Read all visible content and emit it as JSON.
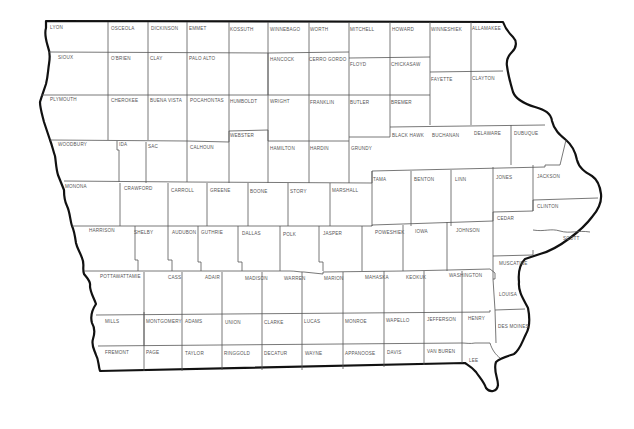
{
  "map": {
    "title": "Iowa Counties",
    "background": "#ffffff",
    "line_color": "#111111"
  },
  "counties": [
    {
      "name": "LYON",
      "x": 50,
      "y": 25
    },
    {
      "name": "OSCEOLA",
      "x": 111,
      "y": 26
    },
    {
      "name": "DICKINSON",
      "x": 151,
      "y": 26
    },
    {
      "name": "EMMET",
      "x": 189,
      "y": 26
    },
    {
      "name": "KOSSUTH",
      "x": 230,
      "y": 27
    },
    {
      "name": "WINNEBAGO",
      "x": 270,
      "y": 27
    },
    {
      "name": "WORTH",
      "x": 310,
      "y": 27
    },
    {
      "name": "MITCHELL",
      "x": 350,
      "y": 27
    },
    {
      "name": "HOWARD",
      "x": 392,
      "y": 27
    },
    {
      "name": "WINNESHIEK",
      "x": 431,
      "y": 27
    },
    {
      "name": "ALLAMAKEE",
      "x": 472,
      "y": 26
    },
    {
      "name": "SIOUX",
      "x": 58,
      "y": 55
    },
    {
      "name": "O'BRIEN",
      "x": 111,
      "y": 56
    },
    {
      "name": "CLAY",
      "x": 150,
      "y": 56
    },
    {
      "name": "PALO ALTO",
      "x": 189,
      "y": 56
    },
    {
      "name": "HANCOCK",
      "x": 270,
      "y": 57
    },
    {
      "name": "CERRO GORDO",
      "x": 309,
      "y": 57
    },
    {
      "name": "FLOYD",
      "x": 350,
      "y": 62
    },
    {
      "name": "CHICKASAW",
      "x": 391,
      "y": 62
    },
    {
      "name": "FAYETTE",
      "x": 431,
      "y": 77
    },
    {
      "name": "CLAYTON",
      "x": 472,
      "y": 76
    },
    {
      "name": "PLYMOUTH",
      "x": 50,
      "y": 97
    },
    {
      "name": "CHEROKEE",
      "x": 111,
      "y": 98
    },
    {
      "name": "BUENA VISTA",
      "x": 150,
      "y": 98
    },
    {
      "name": "POCAHONTAS",
      "x": 190,
      "y": 98
    },
    {
      "name": "HUMBOLDT",
      "x": 230,
      "y": 99
    },
    {
      "name": "WRIGHT",
      "x": 270,
      "y": 99
    },
    {
      "name": "FRANKLIN",
      "x": 310,
      "y": 100
    },
    {
      "name": "BUTLER",
      "x": 350,
      "y": 100
    },
    {
      "name": "BREMER",
      "x": 391,
      "y": 100
    },
    {
      "name": "WEBSTER",
      "x": 230,
      "y": 133
    },
    {
      "name": "BLACK HAWK",
      "x": 392,
      "y": 133
    },
    {
      "name": "BUCHANAN",
      "x": 432,
      "y": 133
    },
    {
      "name": "DELAWARE",
      "x": 474,
      "y": 131
    },
    {
      "name": "DUBUQUE",
      "x": 514,
      "y": 131
    },
    {
      "name": "WOODBURY",
      "x": 58,
      "y": 142
    },
    {
      "name": "IDA",
      "x": 119,
      "y": 142
    },
    {
      "name": "SAC",
      "x": 148,
      "y": 144
    },
    {
      "name": "CALHOUN",
      "x": 190,
      "y": 145
    },
    {
      "name": "HAMILTON",
      "x": 270,
      "y": 146
    },
    {
      "name": "HARDIN",
      "x": 310,
      "y": 146
    },
    {
      "name": "GRUNDY",
      "x": 351,
      "y": 146
    },
    {
      "name": "TAMA",
      "x": 373,
      "y": 177
    },
    {
      "name": "BENTON",
      "x": 414,
      "y": 177
    },
    {
      "name": "LINN",
      "x": 455,
      "y": 177
    },
    {
      "name": "JONES",
      "x": 496,
      "y": 175
    },
    {
      "name": "JACKSON",
      "x": 537,
      "y": 174
    },
    {
      "name": "MONONA",
      "x": 65,
      "y": 184
    },
    {
      "name": "CRAWFORD",
      "x": 124,
      "y": 186
    },
    {
      "name": "CARROLL",
      "x": 171,
      "y": 188
    },
    {
      "name": "GREENE",
      "x": 210,
      "y": 188
    },
    {
      "name": "BOONE",
      "x": 250,
      "y": 189
    },
    {
      "name": "STORY",
      "x": 290,
      "y": 189
    },
    {
      "name": "MARSHALL",
      "x": 332,
      "y": 188
    },
    {
      "name": "CLINTON",
      "x": 537,
      "y": 204
    },
    {
      "name": "CEDAR",
      "x": 497,
      "y": 216
    },
    {
      "name": "SCOTT",
      "x": 563,
      "y": 236
    },
    {
      "name": "HARRISON",
      "x": 89,
      "y": 228
    },
    {
      "name": "SHELBY",
      "x": 134,
      "y": 230
    },
    {
      "name": "AUDUBON",
      "x": 172,
      "y": 230
    },
    {
      "name": "GUTHRIE",
      "x": 201,
      "y": 230
    },
    {
      "name": "DALLAS",
      "x": 242,
      "y": 231
    },
    {
      "name": "POLK",
      "x": 283,
      "y": 232
    },
    {
      "name": "JASPER",
      "x": 323,
      "y": 231
    },
    {
      "name": "POWESHIEK",
      "x": 375,
      "y": 230
    },
    {
      "name": "IOWA",
      "x": 415,
      "y": 229
    },
    {
      "name": "JOHNSON",
      "x": 456,
      "y": 228
    },
    {
      "name": "MUSCATINE",
      "x": 499,
      "y": 261
    },
    {
      "name": "POTTAWATTAMIE",
      "x": 100,
      "y": 274
    },
    {
      "name": "CASS",
      "x": 168,
      "y": 275
    },
    {
      "name": "ADAIR",
      "x": 205,
      "y": 275
    },
    {
      "name": "MADISON",
      "x": 245,
      "y": 276
    },
    {
      "name": "WARREN",
      "x": 284,
      "y": 276
    },
    {
      "name": "MARION",
      "x": 324,
      "y": 276
    },
    {
      "name": "MAHASKA",
      "x": 365,
      "y": 275
    },
    {
      "name": "KEOKUK",
      "x": 406,
      "y": 275
    },
    {
      "name": "WASHINGTON",
      "x": 449,
      "y": 273
    },
    {
      "name": "LOUISA",
      "x": 499,
      "y": 292
    },
    {
      "name": "MILLS",
      "x": 105,
      "y": 319
    },
    {
      "name": "MONTGOMERY",
      "x": 146,
      "y": 319
    },
    {
      "name": "ADAMS",
      "x": 185,
      "y": 319
    },
    {
      "name": "UNION",
      "x": 225,
      "y": 320
    },
    {
      "name": "CLARKE",
      "x": 264,
      "y": 320
    },
    {
      "name": "LUCAS",
      "x": 304,
      "y": 319
    },
    {
      "name": "MONROE",
      "x": 345,
      "y": 319
    },
    {
      "name": "WAPELLO",
      "x": 386,
      "y": 318
    },
    {
      "name": "JEFFERSON",
      "x": 427,
      "y": 317
    },
    {
      "name": "HENRY",
      "x": 468,
      "y": 316
    },
    {
      "name": "DES MOINES",
      "x": 498,
      "y": 324
    },
    {
      "name": "FREMONT",
      "x": 105,
      "y": 350
    },
    {
      "name": "PAGE",
      "x": 146,
      "y": 350
    },
    {
      "name": "TAYLOR",
      "x": 185,
      "y": 351
    },
    {
      "name": "RINGGOLD",
      "x": 224,
      "y": 351
    },
    {
      "name": "DECATUR",
      "x": 264,
      "y": 351
    },
    {
      "name": "WAYNE",
      "x": 305,
      "y": 351
    },
    {
      "name": "APPANOOSE",
      "x": 345,
      "y": 351
    },
    {
      "name": "DAVIS",
      "x": 387,
      "y": 350
    },
    {
      "name": "VAN BUREN",
      "x": 427,
      "y": 349
    },
    {
      "name": "LEE",
      "x": 469,
      "y": 358
    }
  ]
}
